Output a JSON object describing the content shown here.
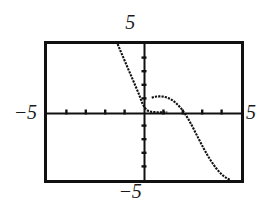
{
  "figure": {
    "kind": "graphing-calculator-viewport",
    "background_color": "#ffffff",
    "ink_color": "#111111"
  },
  "labels": {
    "top": "5",
    "bottom": "−5",
    "left": "−5",
    "right": "5"
  },
  "chart_data": {
    "type": "line",
    "title": "",
    "subtitle": "",
    "xlabel": "",
    "ylabel": "",
    "xlim": [
      -5,
      5
    ],
    "ylim": [
      -5,
      5
    ],
    "xticks": [
      -5,
      -4,
      -3,
      -2,
      -1,
      0,
      1,
      2,
      3,
      4,
      5
    ],
    "yticks": [
      -5,
      -4,
      -3,
      -2,
      -1,
      0,
      1,
      2,
      3,
      4,
      5
    ],
    "xtick_labels": [
      "-5",
      "",
      "",
      "",
      "",
      "",
      "",
      "",
      "",
      "",
      "5"
    ],
    "ytick_labels": [
      "-5",
      "",
      "",
      "",
      "",
      "",
      "",
      "",
      "",
      "",
      "5"
    ],
    "grid": false,
    "legend": false,
    "legend_position": "none",
    "axis_style": "calculator-crosshair",
    "frame": true,
    "annotations": [],
    "series": [
      {
        "name": "branch-left",
        "style": "dotted-pixel-trace",
        "x": [
          -1.36,
          -1.2,
          -1.05,
          -0.9,
          -0.75,
          -0.6,
          -0.45,
          -0.3,
          -0.18,
          -0.08,
          0.0,
          0.06,
          0.12,
          0.18,
          0.24,
          0.3,
          0.36,
          0.42,
          0.5,
          0.6,
          0.75,
          0.95,
          1.2
        ],
        "y": [
          5.0,
          4.45,
          3.95,
          3.45,
          2.95,
          2.45,
          1.95,
          1.45,
          1.0,
          0.62,
          0.4,
          0.28,
          0.18,
          0.11,
          0.07,
          0.04,
          0.02,
          0.01,
          0.0,
          -0.01,
          -0.02,
          -0.02,
          -0.02
        ]
      },
      {
        "name": "branch-right",
        "style": "dotted-pixel-trace",
        "x": [
          0.4,
          0.55,
          0.7,
          0.85,
          1.0,
          1.15,
          1.3,
          1.45,
          1.6,
          1.75,
          1.9,
          2.05,
          2.2,
          2.35,
          2.5,
          2.65,
          2.8,
          2.95,
          3.1,
          3.25,
          3.4,
          3.55,
          3.7,
          3.85,
          4.0,
          4.15,
          4.3,
          4.45
        ],
        "y": [
          1.05,
          1.12,
          1.15,
          1.15,
          1.13,
          1.08,
          1.0,
          0.88,
          0.72,
          0.52,
          0.28,
          0.0,
          -0.32,
          -0.68,
          -1.08,
          -1.5,
          -1.92,
          -2.34,
          -2.74,
          -3.12,
          -3.48,
          -3.8,
          -4.1,
          -4.36,
          -4.58,
          -4.76,
          -4.9,
          -5.0
        ]
      }
    ]
  }
}
